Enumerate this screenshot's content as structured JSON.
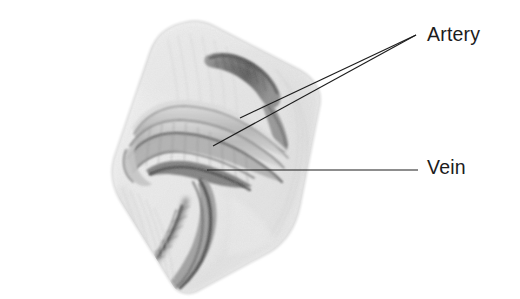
{
  "figure": {
    "type": "anatomical-illustration",
    "medium": "pencil-drawing",
    "background_color": "#ffffff",
    "ink_color": "#1c1c1c",
    "width": 520,
    "height": 299
  },
  "labels": {
    "artery": {
      "text": "Artery",
      "x": 427,
      "y": 25,
      "leader_count": 2
    },
    "vein": {
      "text": "Vein",
      "x": 427,
      "y": 158,
      "leader_count": 1
    }
  },
  "leader_lines": [
    {
      "name": "artery-leader-upper",
      "from": [
        240,
        118
      ],
      "to": [
        416,
        35
      ],
      "target": "artery"
    },
    {
      "name": "artery-leader-lower",
      "from": [
        213,
        146
      ],
      "to": [
        416,
        35
      ],
      "target": "artery"
    },
    {
      "name": "vein-leader",
      "from": [
        207,
        170
      ],
      "to": [
        418,
        170
      ],
      "target": "vein"
    }
  ],
  "drawing": {
    "specimen_outline": "rotated quadrilateral block of tissue, tilted about 15 degrees clockwise, spanning roughly x 85-330, y 20-290",
    "features": [
      "pale translucent tissue block",
      "coiled looping vessel bands crossing the middle",
      "dark elongated vessel descending to lower left",
      "dark short vessel segment at upper right",
      "graphite shading with soft edges"
    ]
  }
}
